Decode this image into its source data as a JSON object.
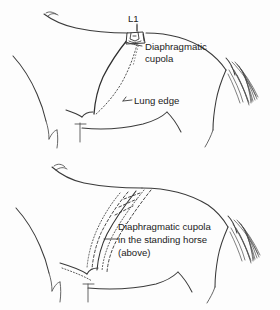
{
  "figure": {
    "background_color": "#fdfdfd",
    "line_color": "#3a3a3a",
    "text_color": "#1b1b1b",
    "width": 280,
    "height": 310
  },
  "panels": [
    {
      "id": "upper",
      "name": "upper-horse-panel",
      "description": "Caudal thorax outline of horse with vertebra L1 marked, solid diaphragmatic cupola line and dotted lung edge line"
    },
    {
      "id": "lower",
      "name": "lower-horse-panel",
      "description": "Second horse outline showing band of diaphragmatic cupola positions in the standing horse"
    }
  ],
  "labels": {
    "l1": "L1",
    "diaphragmatic_cupola_line1": "Diaphragmatic",
    "diaphragmatic_cupola_line2": "cupola",
    "lung_edge": "Lung edge",
    "standing_line1": "Diaphragmatic cupola",
    "standing_line2": "in the standing horse",
    "standing_line3": "(above)"
  },
  "markers": {
    "vertebra_label": "L1",
    "vertebra_name": "first lumbar vertebra"
  }
}
